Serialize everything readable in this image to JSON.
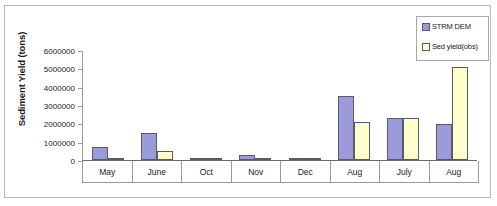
{
  "chart_data": {
    "type": "bar",
    "title": "",
    "xlabel": "",
    "ylabel": "Sediment Yield (tons)",
    "categories": [
      "May",
      "June",
      "Oct",
      "Nov",
      "Dec",
      "Aug",
      "July",
      "Aug"
    ],
    "series": [
      {
        "name": "STRM DEM",
        "color": "#9b9bdc",
        "values": [
          700000,
          1500000,
          100000,
          280000,
          100000,
          3550000,
          2300000,
          2000000
        ]
      },
      {
        "name": "Sed yield(obs)",
        "color": "#ffffcc",
        "values": [
          60000,
          500000,
          40000,
          40000,
          40000,
          2100000,
          2300000,
          5100000
        ]
      }
    ],
    "ylim": [
      0,
      6000000
    ],
    "y_ticks": [
      0,
      1000000,
      2000000,
      3000000,
      4000000,
      5000000,
      6000000
    ],
    "y_tick_labels": [
      "0",
      "1000000",
      "2000000",
      "3000000",
      "4000000",
      "5000000",
      "6000000"
    ],
    "grid": false,
    "legend_position": "top-right"
  },
  "legend": {
    "entries": [
      {
        "label": "STRM DEM",
        "marker": "legend-swatch-icon"
      },
      {
        "label": "Sed yield(obs)",
        "marker": "legend-swatch-icon"
      }
    ]
  }
}
